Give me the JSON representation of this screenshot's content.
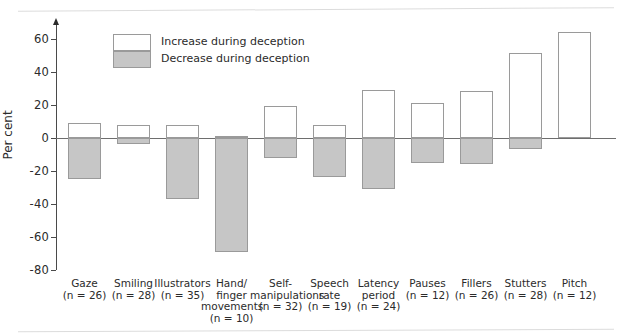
{
  "chart_data": {
    "type": "bar",
    "title": "",
    "subtitle": "",
    "xlabel": "",
    "ylabel": "Per cent",
    "ylim": [
      -80,
      70
    ],
    "yticks": [
      60,
      40,
      20,
      0,
      -20,
      -40,
      -60,
      -80
    ],
    "ytick_labels": [
      "60",
      "40",
      "20",
      "0",
      "-20",
      "-40",
      "-60",
      "-80"
    ],
    "grid": false,
    "legend_position": "upper-left-inside",
    "categories": [
      "Gaze",
      "Smiling",
      "Illustrators",
      "Hand/ finger movements",
      "Self- manipulations",
      "Speech rate",
      "Latency period",
      "Pauses",
      "Fillers",
      "Stutters",
      "Pitch"
    ],
    "category_lines": [
      [
        "Gaze"
      ],
      [
        "Smiling"
      ],
      [
        "Illustrators"
      ],
      [
        "Hand/",
        "finger",
        "movements"
      ],
      [
        "Self-",
        "manipulations"
      ],
      [
        "Speech",
        "rate"
      ],
      [
        "Latency",
        "period"
      ],
      [
        "Pauses"
      ],
      [
        "Fillers"
      ],
      [
        "Stutters"
      ],
      [
        "Pitch"
      ]
    ],
    "sample_sizes": [
      "(n = 26)",
      "(n = 28)",
      "(n = 35)",
      "(n = 10)",
      "(n = 32)",
      "(n = 19)",
      "(n = 24)",
      "(n = 12)",
      "(n = 26)",
      "(n = 28)",
      "(n = 12)"
    ],
    "series": [
      {
        "name": "Increase during deception",
        "color": "#ffffff",
        "values": [
          9,
          8,
          8,
          1,
          19,
          8,
          29,
          21,
          28,
          51,
          64
        ]
      },
      {
        "name": "Decrease during deception",
        "color": "#c6c6c6",
        "values": [
          -25,
          -4,
          -37,
          -69,
          -12,
          -24,
          -31,
          -15,
          -16,
          -7,
          0
        ]
      }
    ],
    "legend": [
      {
        "label": "Increase during deception",
        "swatch": "#ffffff"
      },
      {
        "label": "Decrease during deception",
        "swatch": "#c6c6c6"
      }
    ]
  },
  "axis": {
    "y_title": "Per cent"
  },
  "colors": {
    "increase": "#ffffff",
    "decrease": "#c6c6c6",
    "bar_border": "#9a9a9a",
    "axis": "#4a4a4a",
    "baseline": "#6e6e6e",
    "text": "#2b2b2b"
  }
}
